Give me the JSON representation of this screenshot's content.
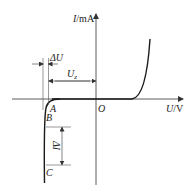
{
  "diagram": {
    "type": "zener-diode-iv-characteristic",
    "y_axis": {
      "label_italic": "I",
      "label_unit": "/mA"
    },
    "x_axis": {
      "label_italic": "U",
      "label_unit": "/V"
    },
    "origin_label": "O",
    "points": {
      "A": "A",
      "B": "B",
      "C": "C"
    },
    "annotations": {
      "delta_u": "ΔU",
      "uz_main": "U",
      "uz_sub": "z",
      "delta_i": "ΔI"
    },
    "colors": {
      "curve": "#1a1a1a",
      "axis": "#333333",
      "guide": "#555555"
    }
  }
}
